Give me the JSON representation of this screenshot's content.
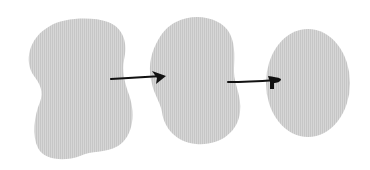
{
  "diagram": {
    "type": "process-flow",
    "background": "#ffffff",
    "fill_color": "#d3d3d3",
    "hatch_color": "#c4c4c4",
    "arrow_color": "#111111",
    "nodes": [
      {
        "id": "blob-1",
        "shape": "irregular-peanut",
        "label": ""
      },
      {
        "id": "blob-2",
        "shape": "irregular-oval",
        "label": ""
      },
      {
        "id": "blob-3",
        "shape": "ellipse",
        "label": ""
      }
    ],
    "edges": [
      {
        "from": "blob-1",
        "to": "blob-2",
        "label": ""
      },
      {
        "from": "blob-2",
        "to": "blob-3",
        "label": ""
      }
    ]
  }
}
